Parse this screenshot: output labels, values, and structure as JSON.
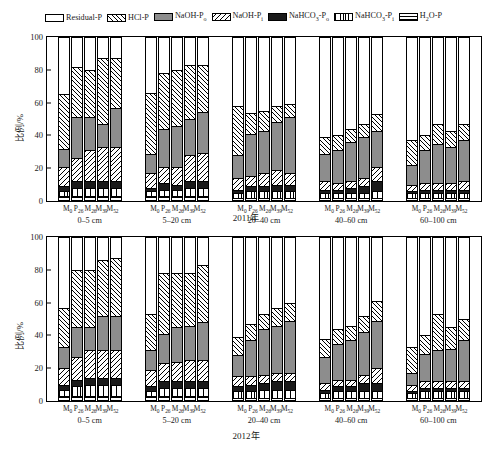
{
  "legend": {
    "items": [
      {
        "label": "Residual-P",
        "sub": "",
        "key": "residual",
        "pattern": "f-res",
        "color": "#ffffff"
      },
      {
        "label": "HCl-P",
        "sub": "",
        "key": "hcl",
        "pattern": "f-hcl",
        "color": "#ffffff"
      },
      {
        "label": "NaOH-P",
        "sub": "o",
        "key": "naoh_po",
        "pattern": "f-naohpo",
        "color": "#8d8d8d"
      },
      {
        "label": "NaOH-P",
        "sub": "i",
        "key": "naoh_pi",
        "pattern": "f-naohpi",
        "color": "#ffffff"
      },
      {
        "label": "NaHCO3-P",
        "sub": "o",
        "key": "nahco3_po",
        "pattern": "f-nahco3po",
        "color": "#1a1a1a"
      },
      {
        "label": "NaHCO3-P",
        "sub": "i",
        "key": "nahco3_pi",
        "pattern": "f-nahco3pi",
        "color": "#ffffff"
      },
      {
        "label": "H2O-P",
        "sub": "",
        "key": "h2o",
        "pattern": "f-h2o",
        "color": "#ffffff"
      }
    ]
  },
  "chart_data": {
    "type": "bar",
    "subtype": "stacked-bar",
    "title": "",
    "xlabel": "",
    "ylabel": "比例/%",
    "ylim": [
      0,
      100
    ],
    "yticks": [
      0,
      20,
      40,
      60,
      80,
      100
    ],
    "grid": false,
    "legend_position": "top",
    "stack_order_bottom_to_top": [
      "h2o",
      "nahco3_pi",
      "nahco3_po",
      "naoh_pi",
      "naoh_po",
      "hcl",
      "residual"
    ],
    "categories": [
      "M0",
      "P26",
      "M26",
      "M39",
      "M52"
    ],
    "depth_groups": [
      "0–5 cm",
      "5–20 cm",
      "20–40 cm",
      "40–60 cm",
      "60–100 cm"
    ],
    "panels": [
      {
        "year": "2011年",
        "groups": [
          {
            "depth": "0–5 cm",
            "bars": [
              {
                "cat": "M0",
                "h2o": 3,
                "nahco3_pi": 3,
                "nahco3_po": 3,
                "naoh_pi": 12,
                "naoh_po": 11,
                "hcl": 33,
                "residual": 35
              },
              {
                "cat": "P26",
                "h2o": 3,
                "nahco3_pi": 5,
                "nahco3_po": 4,
                "naoh_pi": 14,
                "naoh_po": 25,
                "hcl": 31,
                "residual": 18
              },
              {
                "cat": "M26",
                "h2o": 3,
                "nahco3_pi": 5,
                "nahco3_po": 4,
                "naoh_pi": 19,
                "naoh_po": 20,
                "hcl": 29,
                "residual": 20
              },
              {
                "cat": "M39",
                "h2o": 3,
                "nahco3_pi": 5,
                "nahco3_po": 4,
                "naoh_pi": 21,
                "naoh_po": 14,
                "hcl": 40,
                "residual": 13
              },
              {
                "cat": "M52",
                "h2o": 3,
                "nahco3_pi": 5,
                "nahco3_po": 4,
                "naoh_pi": 21,
                "naoh_po": 24,
                "hcl": 30,
                "residual": 13
              }
            ]
          },
          {
            "depth": "5–20 cm",
            "bars": [
              {
                "cat": "M0",
                "h2o": 3,
                "nahco3_pi": 3,
                "nahco3_po": 2,
                "naoh_pi": 9,
                "naoh_po": 12,
                "hcl": 37,
                "residual": 34
              },
              {
                "cat": "P26",
                "h2o": 3,
                "nahco3_pi": 4,
                "nahco3_po": 4,
                "naoh_pi": 10,
                "naoh_po": 23,
                "hcl": 34,
                "residual": 22
              },
              {
                "cat": "M26",
                "h2o": 3,
                "nahco3_pi": 4,
                "nahco3_po": 3,
                "naoh_pi": 11,
                "naoh_po": 25,
                "hcl": 34,
                "residual": 20
              },
              {
                "cat": "M39",
                "h2o": 3,
                "nahco3_pi": 5,
                "nahco3_po": 4,
                "naoh_pi": 16,
                "naoh_po": 22,
                "hcl": 33,
                "residual": 17
              },
              {
                "cat": "M52",
                "h2o": 3,
                "nahco3_pi": 5,
                "nahco3_po": 4,
                "naoh_pi": 17,
                "naoh_po": 25,
                "hcl": 29,
                "residual": 17
              }
            ]
          },
          {
            "depth": "20–40 cm",
            "bars": [
              {
                "cat": "M0",
                "h2o": 2,
                "nahco3_pi": 3,
                "nahco3_po": 2,
                "naoh_pi": 7,
                "naoh_po": 14,
                "hcl": 30,
                "residual": 42
              },
              {
                "cat": "P26",
                "h2o": 2,
                "nahco3_pi": 4,
                "nahco3_po": 3,
                "naoh_pi": 6,
                "naoh_po": 26,
                "hcl": 13,
                "residual": 46
              },
              {
                "cat": "M26",
                "h2o": 2,
                "nahco3_pi": 4,
                "nahco3_po": 3,
                "naoh_pi": 8,
                "naoh_po": 26,
                "hcl": 12,
                "residual": 45
              },
              {
                "cat": "M39",
                "h2o": 2,
                "nahco3_pi": 4,
                "nahco3_po": 4,
                "naoh_pi": 9,
                "naoh_po": 29,
                "hcl": 10,
                "residual": 42
              },
              {
                "cat": "M52",
                "h2o": 2,
                "nahco3_pi": 4,
                "nahco3_po": 4,
                "naoh_pi": 7,
                "naoh_po": 34,
                "hcl": 8,
                "residual": 41
              }
            ]
          },
          {
            "depth": "40–60 cm",
            "bars": [
              {
                "cat": "M0",
                "h2o": 2,
                "nahco3_pi": 3,
                "nahco3_po": 2,
                "naoh_pi": 5,
                "naoh_po": 17,
                "hcl": 10,
                "residual": 61
              },
              {
                "cat": "P26",
                "h2o": 2,
                "nahco3_pi": 3,
                "nahco3_po": 2,
                "naoh_pi": 4,
                "naoh_po": 20,
                "hcl": 9,
                "residual": 60
              },
              {
                "cat": "M26",
                "h2o": 2,
                "nahco3_pi": 3,
                "nahco3_po": 3,
                "naoh_pi": 4,
                "naoh_po": 24,
                "hcl": 8,
                "residual": 56
              },
              {
                "cat": "M39",
                "h2o": 2,
                "nahco3_pi": 3,
                "nahco3_po": 4,
                "naoh_pi": 5,
                "naoh_po": 25,
                "hcl": 8,
                "residual": 53
              },
              {
                "cat": "M52",
                "h2o": 2,
                "nahco3_pi": 4,
                "nahco3_po": 6,
                "naoh_pi": 9,
                "naoh_po": 22,
                "hcl": 10,
                "residual": 47
              }
            ]
          },
          {
            "depth": "60–100 cm",
            "bars": [
              {
                "cat": "M0",
                "h2o": 2,
                "nahco3_pi": 3,
                "nahco3_po": 1,
                "naoh_pi": 4,
                "naoh_po": 12,
                "hcl": 15,
                "residual": 63
              },
              {
                "cat": "P26",
                "h2o": 2,
                "nahco3_pi": 3,
                "nahco3_po": 2,
                "naoh_pi": 4,
                "naoh_po": 20,
                "hcl": 9,
                "residual": 60
              },
              {
                "cat": "M26",
                "h2o": 2,
                "nahco3_pi": 3,
                "nahco3_po": 2,
                "naoh_pi": 4,
                "naoh_po": 24,
                "hcl": 12,
                "residual": 53
              },
              {
                "cat": "M39",
                "h2o": 2,
                "nahco3_pi": 3,
                "nahco3_po": 2,
                "naoh_pi": 4,
                "naoh_po": 22,
                "hcl": 10,
                "residual": 57
              },
              {
                "cat": "M52",
                "h2o": 2,
                "nahco3_pi": 3,
                "nahco3_po": 2,
                "naoh_pi": 5,
                "naoh_po": 25,
                "hcl": 10,
                "residual": 53
              }
            ]
          }
        ]
      },
      {
        "year": "2012年",
        "groups": [
          {
            "depth": "0–5 cm",
            "bars": [
              {
                "cat": "M0",
                "h2o": 3,
                "nahco3_pi": 4,
                "nahco3_po": 3,
                "naoh_pi": 10,
                "naoh_po": 13,
                "hcl": 24,
                "residual": 43
              },
              {
                "cat": "P26",
                "h2o": 3,
                "nahco3_pi": 6,
                "nahco3_po": 4,
                "naoh_pi": 14,
                "naoh_po": 18,
                "hcl": 35,
                "residual": 20
              },
              {
                "cat": "M26",
                "h2o": 3,
                "nahco3_pi": 7,
                "nahco3_po": 4,
                "naoh_pi": 17,
                "naoh_po": 14,
                "hcl": 35,
                "residual": 20
              },
              {
                "cat": "M39",
                "h2o": 3,
                "nahco3_pi": 7,
                "nahco3_po": 4,
                "naoh_pi": 17,
                "naoh_po": 21,
                "hcl": 34,
                "residual": 14
              },
              {
                "cat": "M52",
                "h2o": 3,
                "nahco3_pi": 7,
                "nahco3_po": 4,
                "naoh_pi": 17,
                "naoh_po": 21,
                "hcl": 35,
                "residual": 13
              }
            ]
          },
          {
            "depth": "5–20 cm",
            "bars": [
              {
                "cat": "M0",
                "h2o": 3,
                "nahco3_pi": 3,
                "nahco3_po": 3,
                "naoh_pi": 10,
                "naoh_po": 12,
                "hcl": 22,
                "residual": 47
              },
              {
                "cat": "P26",
                "h2o": 3,
                "nahco3_pi": 5,
                "nahco3_po": 4,
                "naoh_pi": 11,
                "naoh_po": 18,
                "hcl": 37,
                "residual": 22
              },
              {
                "cat": "M26",
                "h2o": 3,
                "nahco3_pi": 5,
                "nahco3_po": 4,
                "naoh_pi": 12,
                "naoh_po": 21,
                "hcl": 33,
                "residual": 22
              },
              {
                "cat": "M39",
                "h2o": 3,
                "nahco3_pi": 5,
                "nahco3_po": 4,
                "naoh_pi": 13,
                "naoh_po": 21,
                "hcl": 32,
                "residual": 22
              },
              {
                "cat": "M52",
                "h2o": 3,
                "nahco3_pi": 5,
                "nahco3_po": 4,
                "naoh_pi": 13,
                "naoh_po": 23,
                "hcl": 35,
                "residual": 17
              }
            ]
          },
          {
            "depth": "20–40 cm",
            "bars": [
              {
                "cat": "M0",
                "h2o": 2,
                "nahco3_pi": 4,
                "nahco3_po": 3,
                "naoh_pi": 6,
                "naoh_po": 13,
                "hcl": 11,
                "residual": 61
              },
              {
                "cat": "P26",
                "h2o": 2,
                "nahco3_pi": 4,
                "nahco3_po": 4,
                "naoh_pi": 5,
                "naoh_po": 22,
                "hcl": 10,
                "residual": 53
              },
              {
                "cat": "M26",
                "h2o": 2,
                "nahco3_pi": 5,
                "nahco3_po": 4,
                "naoh_pi": 5,
                "naoh_po": 28,
                "hcl": 9,
                "residual": 47
              },
              {
                "cat": "M39",
                "h2o": 2,
                "nahco3_pi": 5,
                "nahco3_po": 5,
                "naoh_pi": 5,
                "naoh_po": 29,
                "hcl": 11,
                "residual": 43
              },
              {
                "cat": "M52",
                "h2o": 2,
                "nahco3_pi": 5,
                "nahco3_po": 5,
                "naoh_pi": 5,
                "naoh_po": 32,
                "hcl": 11,
                "residual": 40
              }
            ]
          },
          {
            "depth": "40–60 cm",
            "bars": [
              {
                "cat": "M0",
                "h2o": 2,
                "nahco3_pi": 3,
                "nahco3_po": 2,
                "naoh_pi": 4,
                "naoh_po": 16,
                "hcl": 11,
                "residual": 62
              },
              {
                "cat": "P26",
                "h2o": 2,
                "nahco3_pi": 4,
                "nahco3_po": 3,
                "naoh_pi": 4,
                "naoh_po": 22,
                "hcl": 9,
                "residual": 56
              },
              {
                "cat": "M26",
                "h2o": 2,
                "nahco3_pi": 4,
                "nahco3_po": 3,
                "naoh_pi": 4,
                "naoh_po": 24,
                "hcl": 9,
                "residual": 54
              },
              {
                "cat": "M39",
                "h2o": 2,
                "nahco3_pi": 4,
                "nahco3_po": 5,
                "naoh_pi": 5,
                "naoh_po": 26,
                "hcl": 10,
                "residual": 48
              },
              {
                "cat": "M52",
                "h2o": 2,
                "nahco3_pi": 4,
                "nahco3_po": 5,
                "naoh_pi": 9,
                "naoh_po": 29,
                "hcl": 12,
                "residual": 39
              }
            ]
          },
          {
            "depth": "60–100 cm",
            "bars": [
              {
                "cat": "M0",
                "h2o": 2,
                "nahco3_pi": 3,
                "nahco3_po": 1,
                "naoh_pi": 4,
                "naoh_po": 7,
                "hcl": 16,
                "residual": 67
              },
              {
                "cat": "P26",
                "h2o": 2,
                "nahco3_pi": 4,
                "nahco3_po": 2,
                "naoh_pi": 4,
                "naoh_po": 17,
                "hcl": 11,
                "residual": 60
              },
              {
                "cat": "M26",
                "h2o": 2,
                "nahco3_pi": 4,
                "nahco3_po": 2,
                "naoh_pi": 4,
                "naoh_po": 19,
                "hcl": 22,
                "residual": 47
              },
              {
                "cat": "M39",
                "h2o": 2,
                "nahco3_pi": 4,
                "nahco3_po": 2,
                "naoh_pi": 4,
                "naoh_po": 20,
                "hcl": 13,
                "residual": 55
              },
              {
                "cat": "M52",
                "h2o": 2,
                "nahco3_pi": 4,
                "nahco3_po": 2,
                "naoh_pi": 4,
                "naoh_po": 25,
                "hcl": 13,
                "residual": 50
              }
            ]
          }
        ]
      }
    ]
  },
  "caption": {
    "figure_label": "图"
  }
}
